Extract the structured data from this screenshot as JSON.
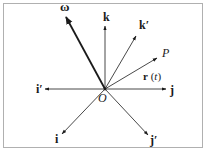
{
  "diagram": {
    "type": "vector-diagram",
    "frame": {
      "x": 3,
      "y": 3,
      "width": 200,
      "height": 144,
      "stroke": "#b0b0b0"
    },
    "origin": {
      "label": "O",
      "x": 105,
      "y": 89
    },
    "colors": {
      "line": "#1a1a1a",
      "frame": "#b0b0b0",
      "background": "#ffffff"
    },
    "vectors": [
      {
        "id": "omega",
        "label": "ω",
        "tip": [
          66,
          17
        ],
        "label_pos": [
          60,
          11
        ],
        "bold": true,
        "heavy": true
      },
      {
        "id": "k",
        "label": "k",
        "tip": [
          105,
          26
        ],
        "label_pos": [
          103,
          21
        ],
        "bold": true,
        "heavy": false
      },
      {
        "id": "k-prime",
        "label": "k′",
        "tip": [
          136,
          36
        ],
        "label_pos": [
          139,
          29
        ],
        "bold": true,
        "heavy": false
      },
      {
        "id": "r",
        "label": "P",
        "tip": [
          157,
          58
        ],
        "label_pos": [
          162,
          57
        ],
        "bold": false,
        "italic": true,
        "heavy": false
      },
      {
        "id": "j",
        "label": "j",
        "tip": [
          166,
          89
        ],
        "label_pos": [
          170,
          94
        ],
        "bold": true,
        "heavy": false
      },
      {
        "id": "i-prime",
        "label": "i′",
        "tip": [
          45,
          89
        ],
        "label_pos": [
          36,
          93
        ],
        "bold": true,
        "heavy": false
      },
      {
        "id": "i",
        "label": "i",
        "tip": [
          62,
          134
        ],
        "label_pos": [
          55,
          143
        ],
        "bold": true,
        "heavy": false
      },
      {
        "id": "j-prime",
        "label": "j′",
        "tip": [
          148,
          135
        ],
        "label_pos": [
          150,
          144
        ],
        "bold": true,
        "heavy": false
      }
    ],
    "annotations": [
      {
        "id": "r-of-t",
        "label_bold": "r",
        "label_rest": " (",
        "label_var": "t",
        "label_close": ")",
        "pos": [
          146,
          79
        ]
      }
    ]
  }
}
